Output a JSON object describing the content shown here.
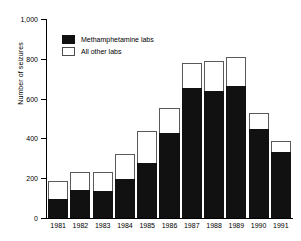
{
  "chart_data": {
    "type": "bar",
    "subtype": "stacked-vertical",
    "title": "",
    "xlabel": "",
    "ylabel": "Number of seizures",
    "categories": [
      "1981",
      "1982",
      "1983",
      "1984",
      "1985",
      "1986",
      "1987",
      "1988",
      "1989",
      "1990",
      "1991"
    ],
    "series": [
      {
        "name": "Methamphetamine labs",
        "color": "#111111",
        "values": [
          95,
          140,
          135,
          198,
          275,
          425,
          655,
          637,
          662,
          448,
          330
        ]
      },
      {
        "name": "All other labs",
        "color": "#ffffff",
        "values": [
          90,
          90,
          95,
          122,
          160,
          130,
          125,
          151,
          148,
          82,
          58
        ]
      }
    ],
    "totals": [
      185,
      230,
      230,
      320,
      435,
      555,
      780,
      788,
      810,
      530,
      388
    ],
    "ylim": [
      0,
      1000
    ],
    "yticks": [
      0,
      200,
      400,
      600,
      800,
      1000
    ],
    "ytick_labels": [
      "0",
      "200",
      "400",
      "600",
      "800",
      "1,000"
    ],
    "grid": false,
    "legend_position": "upper-left-inside"
  },
  "legend": {
    "items": [
      {
        "label": "Methamphetamine labs",
        "swatch": "black"
      },
      {
        "label": "All other labs",
        "swatch": "white"
      }
    ]
  }
}
